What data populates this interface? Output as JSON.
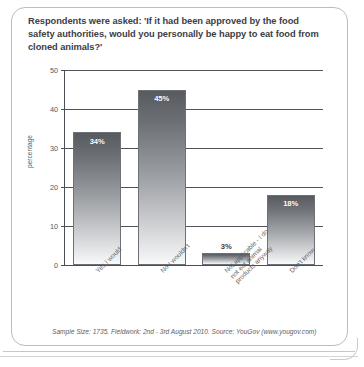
{
  "card": {
    "title": "Respondents were asked: 'If it had been approved by the food safety authorities, would you personally be happy to eat food from cloned animals?'",
    "source_note": "Sample Size: 1735. Fieldwork: 2nd - 3rd August 2010. Source: YouGov (www.yougov.com)"
  },
  "chart_data": {
    "type": "bar",
    "title": "Respondents were asked: 'If it had been approved by the food safety authorities, would you personally be happy to eat food from cloned animals?'",
    "categories": [
      "Yes I would",
      "No I wouldn't",
      "Not applicable - I do not eat animal products anyway",
      "Don't know"
    ],
    "category_lines": [
      [
        "Yes I would"
      ],
      [
        "No I wouldn't"
      ],
      [
        "Not applicable - I do",
        "not eat animal",
        "products anyway"
      ],
      [
        "Don't know"
      ]
    ],
    "values": [
      34,
      45,
      3,
      18
    ],
    "data_labels": [
      "34%",
      "45%",
      "3%",
      "18%"
    ],
    "xlabel": "",
    "ylabel": "percentage",
    "ylim": [
      0,
      50
    ],
    "yticks": [
      0,
      10,
      20,
      30,
      40,
      50
    ],
    "ytick_labels": [
      "0",
      "10",
      "20",
      "30",
      "40",
      "50"
    ],
    "grid": true,
    "legend": false,
    "bar_color_top": "#575b60",
    "bar_color_bottom": "#fbfbfc",
    "axis_color": "#4a4f55"
  }
}
